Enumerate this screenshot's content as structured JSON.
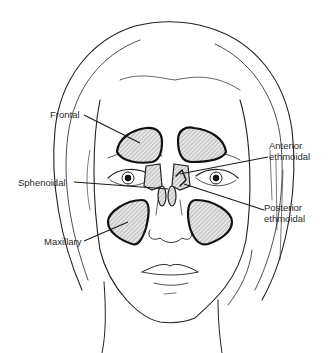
{
  "figure": {
    "labels": {
      "frontal": "Frontal",
      "anterior_ethmoidal": [
        "Anterior",
        "ethmoidal"
      ],
      "sphenoidal": "Sphenoidal",
      "posterior_ethmoidal": [
        "Posterior",
        "ethmoidal"
      ],
      "maxillary": "Maxillary"
    },
    "colors": {
      "line": "#222222",
      "hatch": "#8a8a8a",
      "background": "#ffffff"
    }
  }
}
